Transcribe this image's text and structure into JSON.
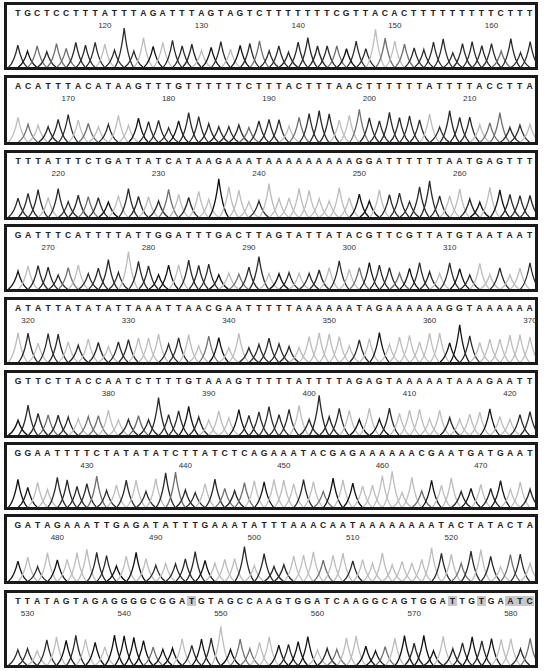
{
  "chart_data": {
    "type": "line",
    "title": "",
    "xlabel": "",
    "ylabel": "",
    "rows": [
      {
        "sequence": "TGCTCCTTTATTTAGATTTAGTAGTCTTTTTTTCGTTACACTTTTTTTTTCTTT",
        "ticks": [
          120,
          130,
          140,
          150,
          160
        ],
        "start": 111,
        "highlights": []
      },
      {
        "sequence": "ACATTTACATAAGTTTGTTTTTTCTTTACTTTAACTTTTTTATTTTACCTTA",
        "ticks": [
          170,
          180,
          190,
          200,
          210
        ],
        "start": 165,
        "highlights": []
      },
      {
        "sequence": "TTTATTTCTGATTATCATAAGAAATAAAAAAAAAGGATTTTTTAATGAGTTT",
        "ticks": [
          220,
          230,
          240,
          250,
          260
        ],
        "start": 216,
        "highlights": []
      },
      {
        "sequence": "GATTTCATTTTATTGGATTTGACTTAGTATTATACGTTCGTTATGTAATAAT",
        "ticks": [
          270,
          280,
          290,
          300,
          310
        ],
        "start": 267,
        "highlights": []
      },
      {
        "sequence": "ATATTATATATTAAATTAACGAATTTTTAAAAAATAGAAAAAAGGTAAAAAA",
        "ticks": [
          320,
          330,
          340,
          350,
          360,
          370
        ],
        "start": 319,
        "highlights": []
      },
      {
        "sequence": "GTTCTTACCAATCTTTTGTAAAGTTTTTATTTTAGAGTAAAAATAAAGAATT",
        "ticks": [
          380,
          390,
          400,
          410,
          420
        ],
        "start": 371,
        "highlights": []
      },
      {
        "sequence": "GGAATTTTCTATATATCTTATCTCAGAAATACGAGAAAAAACGAATGATGAAT",
        "ticks": [
          430,
          440,
          450,
          460,
          470
        ],
        "start": 423,
        "highlights": []
      },
      {
        "sequence": "GATAGAAATTGAGATATTTGAAATATTTAAACAATAAAAAAAATACTATACTA",
        "ticks": [
          480,
          490,
          500,
          510,
          520
        ],
        "start": 476,
        "highlights": []
      },
      {
        "sequence": "TTATAGTAGAGGGGCGGATGTAGCCAAGTGGATCAAGGCAGTGGATTGTGAATC",
        "ticks": [
          530,
          540,
          550,
          560,
          570,
          580
        ],
        "start": 529,
        "highlights": [
          18,
          45,
          48,
          51,
          52,
          53
        ]
      }
    ]
  }
}
